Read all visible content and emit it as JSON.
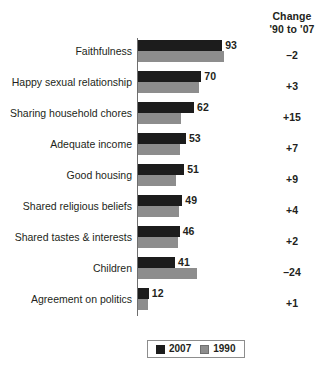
{
  "change_column": {
    "header_line1": "Change",
    "header_line2": "'90 to '07"
  },
  "legend": {
    "items": [
      {
        "label": "2007",
        "color": "#1c1c1c"
      },
      {
        "label": "1990",
        "color": "#8d8d8d"
      }
    ]
  },
  "chart_data": {
    "type": "bar",
    "title": "",
    "subtitle": "",
    "xlabel": "",
    "ylabel": "",
    "orientation": "horizontal",
    "grid": false,
    "legend_position": "bottom-center",
    "xlim": [
      0,
      100
    ],
    "categories": [
      "Faithfulness",
      "Happy sexual relationship",
      "Sharing household chores",
      "Adequate income",
      "Good housing",
      "Shared religious beliefs",
      "Shared tastes & interests",
      "Children",
      "Agreement on politics"
    ],
    "series": [
      {
        "name": "2007",
        "color": "#1c1c1c",
        "values": [
          93,
          70,
          62,
          53,
          51,
          49,
          46,
          41,
          12
        ]
      },
      {
        "name": "1990",
        "color": "#8d8d8d",
        "values": [
          95,
          67,
          47,
          46,
          42,
          45,
          44,
          65,
          11
        ]
      }
    ],
    "data_labels": [
      "93",
      "70",
      "62",
      "53",
      "51",
      "49",
      "46",
      "41",
      "12"
    ],
    "annotations": {
      "change_header": "Change '90 to '07",
      "change_values": [
        "–2",
        "+3",
        "+15",
        "+7",
        "+9",
        "+4",
        "+2",
        "–24",
        "+1"
      ]
    }
  }
}
